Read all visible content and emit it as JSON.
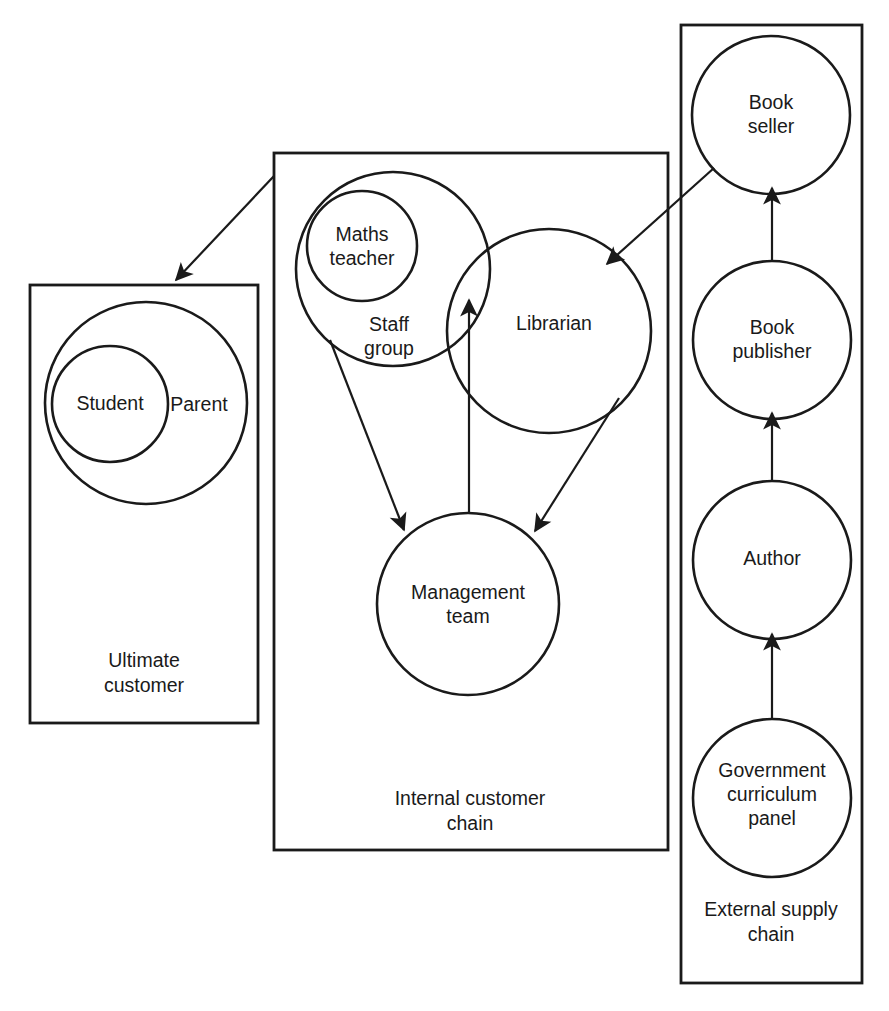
{
  "diagram": {
    "stroke_color": "#1a1a1a",
    "background_color": "#ffffff",
    "boxes": [
      {
        "id": "ultimate-customer",
        "label_line1": "Ultimate",
        "label_line2": "customer"
      },
      {
        "id": "internal-customer-chain",
        "label_line1": "Internal customer",
        "label_line2": "chain"
      },
      {
        "id": "external-supply-chain",
        "label_line1": "External supply",
        "label_line2": "chain"
      }
    ],
    "nodes": [
      {
        "id": "student",
        "label_line1": "Student",
        "label_line2": ""
      },
      {
        "id": "parent",
        "label_line1": "Parent",
        "label_line2": ""
      },
      {
        "id": "maths-teacher",
        "label_line1": "Maths",
        "label_line2": "teacher"
      },
      {
        "id": "staff-group",
        "label_line1": "Staff",
        "label_line2": "group"
      },
      {
        "id": "librarian",
        "label_line1": "Librarian",
        "label_line2": ""
      },
      {
        "id": "management-team",
        "label_line1": "Management",
        "label_line2": "team"
      },
      {
        "id": "book-seller",
        "label_line1": "Book",
        "label_line2": "seller"
      },
      {
        "id": "book-publisher",
        "label_line1": "Book",
        "label_line2": "publisher"
      },
      {
        "id": "author",
        "label_line1": "Author",
        "label_line2": ""
      },
      {
        "id": "government-curriculum-panel",
        "label_line1": "Government",
        "label_line2": "curriculum",
        "label_line3": "panel"
      }
    ],
    "arrows": [
      {
        "id": "internal-chain-to-ultimate-customer",
        "from": "internal-customer-chain",
        "to": "ultimate-customer"
      },
      {
        "id": "book-seller-to-librarian",
        "from": "book-seller",
        "to": "librarian"
      },
      {
        "id": "staff-group-to-management-team",
        "from": "staff-group",
        "to": "management-team"
      },
      {
        "id": "librarian-to-management-team",
        "from": "librarian",
        "to": "management-team"
      },
      {
        "id": "management-team-to-staff-librarian-overlap",
        "from": "management-team",
        "to": "staff-librarian-overlap"
      },
      {
        "id": "book-publisher-to-book-seller",
        "from": "book-publisher",
        "to": "book-seller"
      },
      {
        "id": "author-to-book-publisher",
        "from": "author",
        "to": "book-publisher"
      },
      {
        "id": "government-panel-to-author",
        "from": "government-curriculum-panel",
        "to": "author"
      }
    ]
  }
}
